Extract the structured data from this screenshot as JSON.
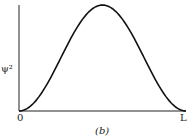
{
  "chart_data": {
    "type": "line",
    "title": "",
    "caption": "(b)",
    "xlabel": "",
    "ylabel": "ψ²",
    "x_ticks": [
      "0",
      "L"
    ],
    "xlim": [
      0,
      1
    ],
    "ylim": [
      0,
      1
    ],
    "grid": false,
    "legend": null,
    "series": [
      {
        "name": "psi^2 = sin^2(pi x / L)",
        "x": [
          0,
          0.1,
          0.2,
          0.3,
          0.4,
          0.5,
          0.6,
          0.7,
          0.8,
          0.9,
          1.0
        ],
        "y": [
          0,
          0.095,
          0.345,
          0.655,
          0.905,
          1.0,
          0.905,
          0.655,
          0.345,
          0.095,
          0
        ]
      }
    ]
  },
  "labels": {
    "ylabel": "ψ²",
    "x_origin": "0",
    "x_end": "L",
    "caption": "(b)"
  }
}
